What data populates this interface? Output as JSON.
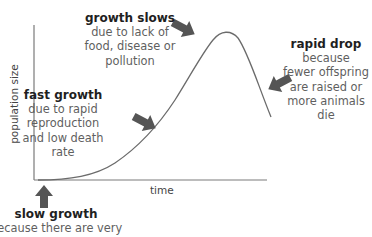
{
  "diagram": {
    "type": "population growth curve",
    "axes": {
      "x_label": "time",
      "y_label": "population size"
    },
    "annotations": [
      {
        "id": "growth_slows",
        "heading": "growth slows",
        "lines": [
          "due to lack of",
          "food, disease or",
          "pollution"
        ]
      },
      {
        "id": "rapid_drop",
        "heading": "rapid drop",
        "lines": [
          "because",
          "fewer offspring",
          "are raised or",
          "more animals",
          "die"
        ]
      },
      {
        "id": "fast_growth",
        "heading": "fast growth",
        "lines": [
          "due to rapid",
          "reproduction",
          "and low death",
          "rate"
        ]
      },
      {
        "id": "slow_growth",
        "heading": "slow growth",
        "lines": [
          "because there are very"
        ]
      }
    ],
    "colors": {
      "curve": "#6b6b6b",
      "axis": "#7a7a7a",
      "arrow": "#555555",
      "heading_text": "#1f1f1f",
      "body_text": "#5f5f5f"
    }
  }
}
